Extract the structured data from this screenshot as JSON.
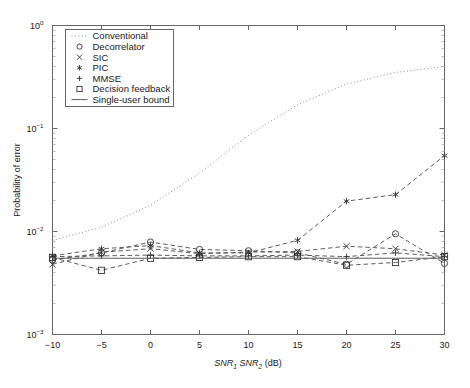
{
  "chart_data": {
    "type": "line",
    "title": "",
    "xlabel": "SNR1 SNR2 (dB)",
    "xlabel_parts": {
      "snr1": "SNR",
      "sub1": "1",
      "snr2": "SNR",
      "sub2": "2",
      "unit": "(dB)"
    },
    "ylabel": "Probability of error",
    "x": [
      -10,
      -5,
      0,
      5,
      10,
      15,
      20,
      25,
      30
    ],
    "xticklabels": [
      "10",
      "5",
      "0",
      "5",
      "10",
      "15",
      "20",
      "25",
      "30"
    ],
    "xlim": [
      -10,
      30
    ],
    "yticklabels": [
      "10",
      "10",
      "10",
      "10"
    ],
    "ytickexponents": [
      "0",
      "-1",
      "-2",
      "-3"
    ],
    "ylim": [
      0.001,
      1.0
    ],
    "yscale": "log",
    "grid": false,
    "legend_position": "upper-left",
    "series": [
      {
        "name": "Conventional",
        "marker": "none",
        "linestyle": "dotted",
        "values": [
          0.0082,
          0.011,
          0.018,
          0.037,
          0.086,
          0.17,
          0.27,
          0.35,
          0.4
        ]
      },
      {
        "name": "Decorrelator",
        "marker": "circle",
        "linestyle": "dashed",
        "values": [
          0.0053,
          0.0062,
          0.0079,
          0.0067,
          0.0065,
          0.0062,
          0.0048,
          0.0095,
          0.0049
        ]
      },
      {
        "name": "SIC",
        "marker": "x",
        "linestyle": "dashed",
        "values": [
          0.0048,
          0.0063,
          0.0068,
          0.0061,
          0.0063,
          0.0064,
          0.0072,
          0.0068,
          0.0059
        ]
      },
      {
        "name": "PIC",
        "marker": "asterisk",
        "linestyle": "dashed",
        "values": [
          0.0058,
          0.0068,
          0.0073,
          0.0062,
          0.0062,
          0.0082,
          0.0197,
          0.0228,
          0.0545
        ]
      },
      {
        "name": "MMSE",
        "marker": "plus",
        "linestyle": "dashed",
        "values": [
          0.0057,
          0.0058,
          0.0059,
          0.0058,
          0.0058,
          0.0059,
          0.0057,
          0.0062,
          0.0057
        ]
      },
      {
        "name": "Decision feedback",
        "marker": "square",
        "linestyle": "dashed",
        "values": [
          0.0056,
          0.0042,
          0.0055,
          0.0056,
          0.0057,
          0.0057,
          0.0047,
          0.005,
          0.0057
        ]
      },
      {
        "name": "Single-user bound",
        "marker": "none",
        "linestyle": "solid",
        "values": [
          0.0055,
          0.0055,
          0.0055,
          0.0055,
          0.0055,
          0.0055,
          0.0055,
          0.0055,
          0.0055
        ]
      }
    ],
    "colors": {
      "axis": "#4a4a4a",
      "line": "#555555",
      "text": "#1a1a1a",
      "background": "#ffffff"
    }
  },
  "legend": {
    "items": [
      {
        "label": "Conventional",
        "marker": "none",
        "linestyle": "dotted"
      },
      {
        "label": "Decorrelator",
        "marker": "circle",
        "linestyle": "none"
      },
      {
        "label": "SIC",
        "marker": "x",
        "linestyle": "none"
      },
      {
        "label": "PIC",
        "marker": "asterisk",
        "linestyle": "none"
      },
      {
        "label": "MMSE",
        "marker": "plus",
        "linestyle": "none"
      },
      {
        "label": "Decision feedback",
        "marker": "square",
        "linestyle": "none"
      },
      {
        "label": "Single-user bound",
        "marker": "none",
        "linestyle": "solid"
      }
    ]
  }
}
